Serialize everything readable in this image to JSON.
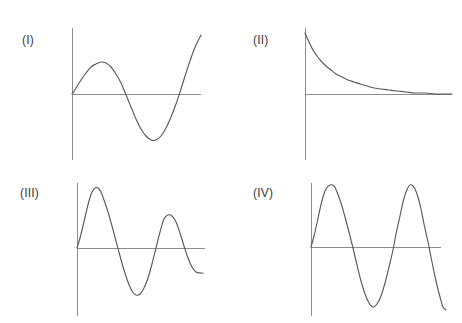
{
  "figure": {
    "title": "",
    "background_color": "#ffffff",
    "axis_color": "#8c8c8c",
    "curve_color": "#5a5a5a",
    "width": 462,
    "height": 323
  },
  "chart_data": {
    "type": "line",
    "title": "",
    "xlabel": "",
    "ylabel": "",
    "grid": false,
    "legend": "none",
    "panels": [
      {
        "label": "(I)",
        "label_x": 22,
        "label_y": 33,
        "origin_x": 72,
        "origin_y": 94,
        "x_axis_start": 72,
        "x_axis_end": 201,
        "y_axis_top": 28,
        "y_axis_bottom": 160,
        "function": "sine, one period, constant amplitude",
        "formula": "y = A*sin(x)",
        "amplitude": 33,
        "periods": 1.1,
        "x_range": [
          0,
          129
        ],
        "ylim": [
          -60,
          60
        ],
        "points": [
          [
            72,
            94
          ],
          [
            76,
            88
          ],
          [
            81,
            80
          ],
          [
            86,
            73
          ],
          [
            91,
            67
          ],
          [
            96,
            64
          ],
          [
            101,
            62
          ],
          [
            106,
            63
          ],
          [
            111,
            67
          ],
          [
            116,
            74
          ],
          [
            121,
            83
          ],
          [
            126,
            95
          ],
          [
            131,
            107
          ],
          [
            136,
            119
          ],
          [
            141,
            129
          ],
          [
            146,
            136
          ],
          [
            151,
            140
          ],
          [
            156,
            140
          ],
          [
            161,
            136
          ],
          [
            166,
            128
          ],
          [
            171,
            117
          ],
          [
            176,
            104
          ],
          [
            181,
            89
          ],
          [
            186,
            73
          ],
          [
            191,
            58
          ],
          [
            196,
            45
          ],
          [
            201,
            35
          ]
        ]
      },
      {
        "label": "(II)",
        "label_x": 253,
        "label_y": 33,
        "origin_x": 305,
        "origin_y": 94,
        "x_axis_start": 305,
        "x_axis_end": 452,
        "y_axis_top": 28,
        "y_axis_bottom": 160,
        "function": "exponential decay",
        "formula": "y = A*e^(-kx)",
        "amplitude": 61,
        "periods": 0,
        "x_range": [
          0,
          147
        ],
        "ylim": [
          0,
          70
        ],
        "points": [
          [
            305,
            33
          ],
          [
            309,
            42
          ],
          [
            313,
            50
          ],
          [
            317,
            56
          ],
          [
            321,
            61
          ],
          [
            326,
            66
          ],
          [
            331,
            70
          ],
          [
            336,
            74
          ],
          [
            342,
            77
          ],
          [
            348,
            80
          ],
          [
            354,
            82
          ],
          [
            360,
            84
          ],
          [
            367,
            86
          ],
          [
            374,
            88
          ],
          [
            381,
            89
          ],
          [
            389,
            90
          ],
          [
            397,
            91
          ],
          [
            406,
            92
          ],
          [
            415,
            93
          ],
          [
            425,
            93
          ],
          [
            435,
            94
          ],
          [
            445,
            94
          ],
          [
            452,
            94
          ]
        ]
      },
      {
        "label": "(III)",
        "label_x": 20,
        "label_y": 186,
        "origin_x": 77,
        "origin_y": 248,
        "x_axis_start": 77,
        "x_axis_end": 205,
        "y_axis_top": 183,
        "y_axis_bottom": 316,
        "function": "damped sine, decaying amplitude",
        "formula": "y = A*e^(-kx)*sin(x)",
        "amplitude": 60,
        "periods": 1.75,
        "x_range": [
          0,
          128
        ],
        "ylim": [
          -60,
          62
        ],
        "points": [
          [
            77,
            248
          ],
          [
            80,
            238
          ],
          [
            83,
            226
          ],
          [
            86,
            213
          ],
          [
            89,
            201
          ],
          [
            92,
            192
          ],
          [
            95,
            188
          ],
          [
            98,
            188
          ],
          [
            101,
            192
          ],
          [
            104,
            200
          ],
          [
            108,
            212
          ],
          [
            112,
            226
          ],
          [
            116,
            241
          ],
          [
            120,
            256
          ],
          [
            124,
            270
          ],
          [
            128,
            282
          ],
          [
            132,
            291
          ],
          [
            136,
            295
          ],
          [
            140,
            294
          ],
          [
            144,
            288
          ],
          [
            148,
            278
          ],
          [
            152,
            264
          ],
          [
            156,
            248
          ],
          [
            160,
            232
          ],
          [
            164,
            219
          ],
          [
            168,
            215
          ],
          [
            172,
            216
          ],
          [
            176,
            222
          ],
          [
            180,
            233
          ],
          [
            184,
            246
          ],
          [
            188,
            258
          ],
          [
            192,
            267
          ],
          [
            196,
            272
          ],
          [
            200,
            273
          ],
          [
            203,
            273
          ]
        ]
      },
      {
        "label": "(IV)",
        "label_x": 253,
        "label_y": 186,
        "origin_x": 311,
        "origin_y": 247,
        "x_axis_start": 311,
        "x_axis_end": 441,
        "y_axis_top": 183,
        "y_axis_bottom": 316,
        "function": "sine, two periods, constant amplitude",
        "formula": "y = A*sin(2x)",
        "amplitude": 62,
        "periods": 2,
        "x_range": [
          0,
          130
        ],
        "ylim": [
          -62,
          62
        ],
        "points": [
          [
            311,
            247
          ],
          [
            314,
            236
          ],
          [
            317,
            223
          ],
          [
            320,
            209
          ],
          [
            323,
            197
          ],
          [
            326,
            189
          ],
          [
            330,
            185
          ],
          [
            334,
            186
          ],
          [
            337,
            192
          ],
          [
            341,
            203
          ],
          [
            345,
            217
          ],
          [
            349,
            232
          ],
          [
            353,
            248
          ],
          [
            357,
            265
          ],
          [
            361,
            281
          ],
          [
            365,
            294
          ],
          [
            369,
            303
          ],
          [
            373,
            307
          ],
          [
            377,
            304
          ],
          [
            381,
            296
          ],
          [
            385,
            283
          ],
          [
            389,
            267
          ],
          [
            393,
            250
          ],
          [
            396,
            234
          ],
          [
            400,
            216
          ],
          [
            403,
            202
          ],
          [
            406,
            192
          ],
          [
            409,
            186
          ],
          [
            412,
            185
          ],
          [
            415,
            189
          ],
          [
            418,
            197
          ],
          [
            421,
            209
          ],
          [
            424,
            224
          ],
          [
            428,
            242
          ],
          [
            432,
            262
          ],
          [
            436,
            281
          ],
          [
            440,
            297
          ],
          [
            443,
            307
          ],
          [
            446,
            310
          ]
        ]
      }
    ]
  }
}
